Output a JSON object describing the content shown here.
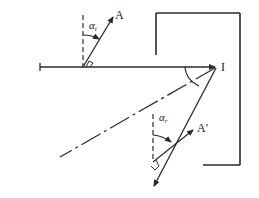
{
  "diagram": {
    "labels": {
      "incident_point_arrow": "A",
      "incident_angle_base": "α",
      "incident_angle_sub": "i",
      "mirror_point": "I",
      "reflected_arrow": "A′",
      "reflected_angle_base": "α",
      "reflected_angle_sub": "r"
    },
    "colors": {
      "stroke": "#2a2a2a",
      "background": "#ffffff"
    }
  }
}
